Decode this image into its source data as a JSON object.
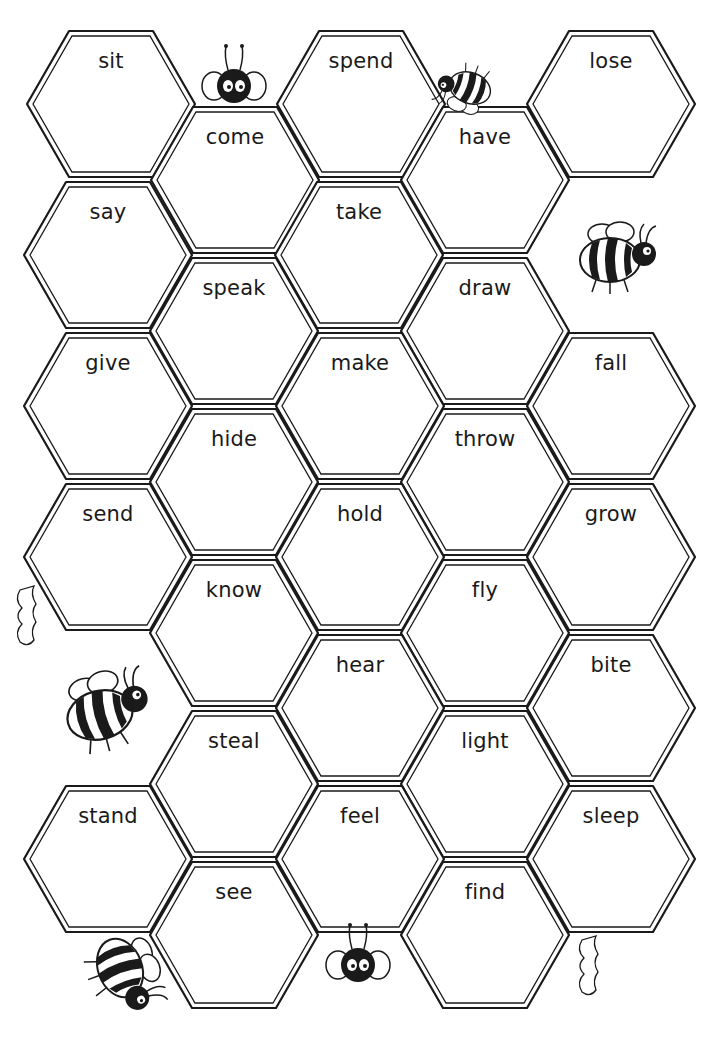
{
  "worksheet": {
    "title": "Irregular verbs honeycomb",
    "colors": {
      "ink": "#1a1a1a",
      "paper": "#ffffff"
    },
    "cells": [
      {
        "word": "sit",
        "cx": 111,
        "cy": 104
      },
      {
        "word": "spend",
        "cx": 361,
        "cy": 104
      },
      {
        "word": "lose",
        "cx": 611,
        "cy": 104
      },
      {
        "word": "come",
        "cx": 235,
        "cy": 180
      },
      {
        "word": "have",
        "cx": 485,
        "cy": 180
      },
      {
        "word": "say",
        "cx": 108,
        "cy": 255
      },
      {
        "word": "take",
        "cx": 359,
        "cy": 255
      },
      {
        "word": "speak",
        "cx": 234,
        "cy": 331
      },
      {
        "word": "draw",
        "cx": 485,
        "cy": 331
      },
      {
        "word": "give",
        "cx": 108,
        "cy": 406
      },
      {
        "word": "make",
        "cx": 360,
        "cy": 406
      },
      {
        "word": "fall",
        "cx": 611,
        "cy": 406
      },
      {
        "word": "hide",
        "cx": 234,
        "cy": 482
      },
      {
        "word": "throw",
        "cx": 485,
        "cy": 482
      },
      {
        "word": "send",
        "cx": 108,
        "cy": 557
      },
      {
        "word": "hold",
        "cx": 360,
        "cy": 557
      },
      {
        "word": "grow",
        "cx": 611,
        "cy": 557
      },
      {
        "word": "know",
        "cx": 234,
        "cy": 633
      },
      {
        "word": "fly",
        "cx": 485,
        "cy": 633
      },
      {
        "word": "hear",
        "cx": 360,
        "cy": 708
      },
      {
        "word": "bite",
        "cx": 611,
        "cy": 708
      },
      {
        "word": "steal",
        "cx": 234,
        "cy": 784
      },
      {
        "word": "light",
        "cx": 485,
        "cy": 784
      },
      {
        "word": "stand",
        "cx": 108,
        "cy": 859
      },
      {
        "word": "feel",
        "cx": 360,
        "cy": 859
      },
      {
        "word": "sleep",
        "cx": 611,
        "cy": 859
      },
      {
        "word": "see",
        "cx": 234,
        "cy": 935
      },
      {
        "word": "find",
        "cx": 485,
        "cy": 935
      }
    ],
    "decorations": [
      {
        "name": "bee-peeking-top",
        "x": 234,
        "y": 100
      },
      {
        "name": "bee-crawling-top",
        "x": 480,
        "y": 88
      },
      {
        "name": "bee-standing-right",
        "x": 600,
        "y": 265
      },
      {
        "name": "bee-flying-left",
        "x": 90,
        "y": 710
      },
      {
        "name": "bee-bottom-left",
        "x": 115,
        "y": 970
      },
      {
        "name": "bee-hanging-bottom",
        "x": 358,
        "y": 965
      },
      {
        "name": "honey-drip-left",
        "x": 30,
        "y": 600
      },
      {
        "name": "honey-drip-right",
        "x": 590,
        "y": 960
      }
    ]
  }
}
